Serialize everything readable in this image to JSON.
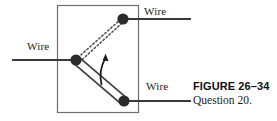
{
  "figure": {
    "caption_title": "FIGURE 26–34",
    "caption_subtitle": "Question 20.",
    "labels": {
      "wire_left": "Wire",
      "wire_top": "Wire",
      "wire_bottom": "Wire"
    },
    "colors": {
      "line": "#3a3a3a",
      "node": "#2b2b2b",
      "frame": "#6e6e6e",
      "dotted": "#4a4a4a",
      "text": "#1c1c1c",
      "caption": "#0f0f0f",
      "background": "#ffffff"
    },
    "geometry": {
      "frame": {
        "x": 57,
        "y": 5,
        "width": 82,
        "height": 108
      },
      "pivot_node": {
        "cx": 76,
        "cy": 60,
        "r": 5.5
      },
      "top_node": {
        "cx": 123,
        "cy": 19,
        "r": 5.5
      },
      "bottom_node": {
        "cx": 124,
        "cy": 101,
        "r": 5.5
      },
      "wire_left": {
        "x1": 12,
        "y1": 60,
        "x2": 76,
        "y2": 60
      },
      "wire_top": {
        "x1": 123,
        "y1": 19,
        "x2": 191,
        "y2": 19
      },
      "wire_bottom": {
        "x1": 124,
        "y1": 101,
        "x2": 191,
        "y2": 101
      },
      "rod": {
        "x1": 76,
        "y1": 60,
        "x2": 124,
        "y2": 101
      },
      "dotted_upper": {
        "x1": 78,
        "y1": 58,
        "x2": 120,
        "y2": 20
      },
      "dotted_lower": {
        "x1": 79,
        "y1": 62,
        "x2": 121,
        "y2": 24
      },
      "rotation_arrow": {
        "from_x": 101,
        "from_y": 84,
        "to_x": 106,
        "to_y": 55
      }
    }
  }
}
